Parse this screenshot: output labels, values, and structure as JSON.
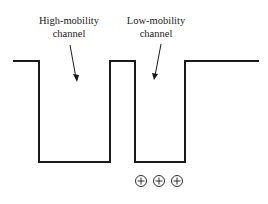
{
  "diagram": {
    "labels": [
      {
        "id": "high",
        "line1": "High-mobility",
        "line2": "channel"
      },
      {
        "id": "low",
        "line1": "Low-mobility",
        "line2": "channel"
      }
    ],
    "charge_symbols": [
      "+",
      "+",
      "+"
    ],
    "colors": {
      "line": "#1a1a1a",
      "text": "#222222"
    }
  }
}
